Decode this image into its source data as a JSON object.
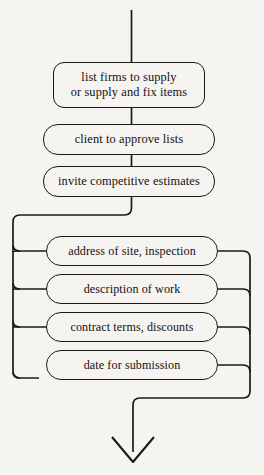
{
  "diagram": {
    "type": "flowchart",
    "orientation": "top-to-bottom",
    "background_color": "#f6f4f1",
    "line_color": "#1c1a19",
    "text_color": "#14120f",
    "main_steps": [
      {
        "id": "list-firms",
        "label": "list firms to supply\nor supply and fix items"
      },
      {
        "id": "client-approve",
        "label": "client to approve lists"
      },
      {
        "id": "invite-estimates",
        "label": "invite competitive estimates"
      }
    ],
    "parallel_steps": [
      {
        "id": "address-site",
        "label": "address of site, inspection"
      },
      {
        "id": "description-work",
        "label": "description of work"
      },
      {
        "id": "contract-terms",
        "label": "contract terms, discounts"
      },
      {
        "id": "date-submission",
        "label": "date for submission"
      }
    ],
    "connectors": {
      "entry_arrow": "line-in-from-top",
      "split_rail": "left-rail",
      "merge_rail": "right-rail",
      "exit_arrow": "arrow-down"
    }
  }
}
